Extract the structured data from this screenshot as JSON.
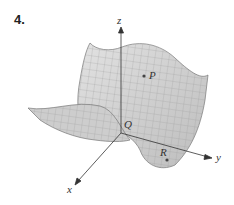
{
  "problem_number": "4.",
  "axes": {
    "x": "x",
    "y": "y",
    "z": "z"
  },
  "points": {
    "P": "P",
    "Q": "Q",
    "R": "R"
  },
  "colors": {
    "surface": "#d4d4d4",
    "grid": "#9a9a9a",
    "axis": "#333333"
  }
}
